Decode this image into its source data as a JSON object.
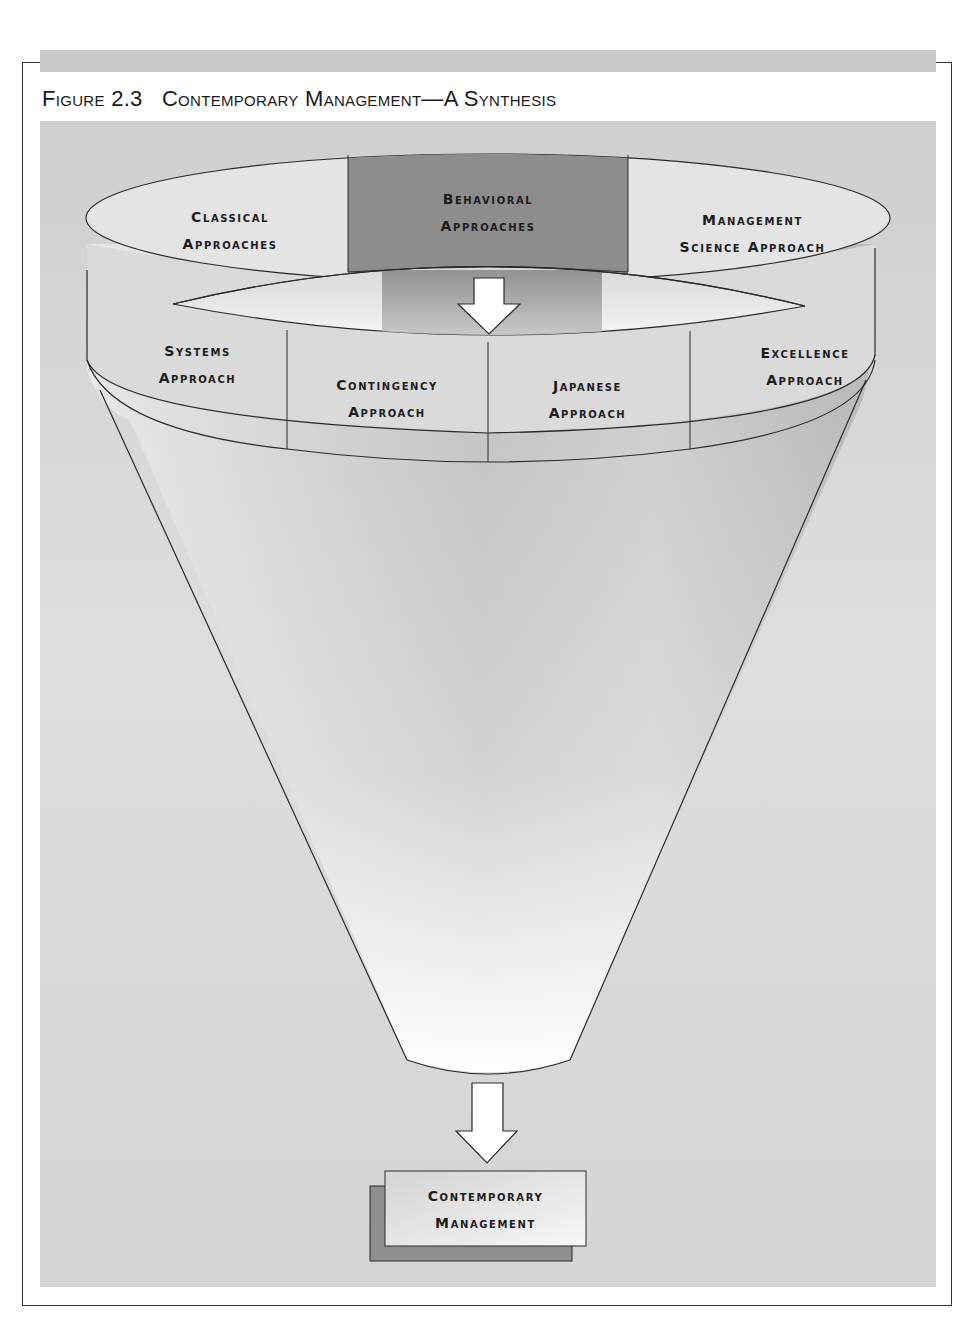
{
  "figure": {
    "number": "Figure 2.3",
    "title": "Contemporary Management—A Synthesis"
  },
  "ring_top": [
    {
      "line1": "Classical",
      "line2": "Approaches"
    },
    {
      "line1": "Behavioral",
      "line2": "Approaches"
    },
    {
      "line1": "Management",
      "line2": "Science Approach"
    }
  ],
  "ring_band": [
    {
      "line1": "Systems",
      "line2": "Approach"
    },
    {
      "line1": "Contingency",
      "line2": "Approach"
    },
    {
      "line1": "Japanese",
      "line2": "Approach"
    },
    {
      "line1": "Excellence",
      "line2": "Approach"
    }
  ],
  "result": {
    "line1": "Contemporary",
    "line2": "Management"
  },
  "icons": {
    "top_arrow": "arrow-down-icon",
    "bottom_arrow": "arrow-down-icon"
  },
  "colors": {
    "panel": "#d6d6d6",
    "behavioral_highlight": "#8c8c8c",
    "ring_light": "#e6e6e6",
    "result_shadow": "#8f8f8f",
    "outline": "#2a2a2a"
  }
}
